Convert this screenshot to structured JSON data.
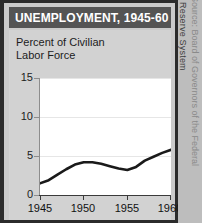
{
  "figure": {
    "title": "UNEMPLOYMENT, 1945-60",
    "subtitle": "Percent of Civilian\nLabor Force",
    "source_credit": "Source: Board of Governors of the Federal",
    "source_credit_2": "Reserve System",
    "colors": {
      "title_bar": "#545454",
      "title_text": "#ffffff",
      "panel_background": "#cacaca",
      "body_background": "#d2d2d2",
      "plot_background": "#ffffff",
      "line": "#1a1a1a",
      "border": "#2b2b2b",
      "gridline": "#e6e6e6"
    }
  },
  "chart_data": {
    "type": "line",
    "title": "UNEMPLOYMENT, 1945-60",
    "subtitle": "Percent of Civilian Labor Force",
    "xlabel": "",
    "ylabel": "Percent of Civilian Labor Force",
    "xlim": [
      1945,
      1960
    ],
    "ylim": [
      0,
      15
    ],
    "yticks": [
      0,
      5,
      10,
      15
    ],
    "ytick_labels": [
      "0",
      "5",
      "10",
      "15"
    ],
    "xticks": [
      1945,
      1950,
      1955,
      1960
    ],
    "xtick_labels": [
      "1945",
      "1950",
      "1955",
      "1960"
    ],
    "grid": true,
    "legend": "none",
    "series": [
      {
        "name": "Unemployment rate",
        "x": [
          1945,
          1946,
          1947,
          1948,
          1949,
          1950,
          1951,
          1952,
          1953,
          1954,
          1955,
          1956,
          1957,
          1958,
          1959,
          1960
        ],
        "values": [
          1.5,
          1.9,
          2.6,
          3.3,
          3.9,
          4.2,
          4.2,
          4.0,
          3.7,
          3.4,
          3.2,
          3.6,
          4.4,
          4.9,
          5.4,
          5.8
        ]
      }
    ]
  }
}
